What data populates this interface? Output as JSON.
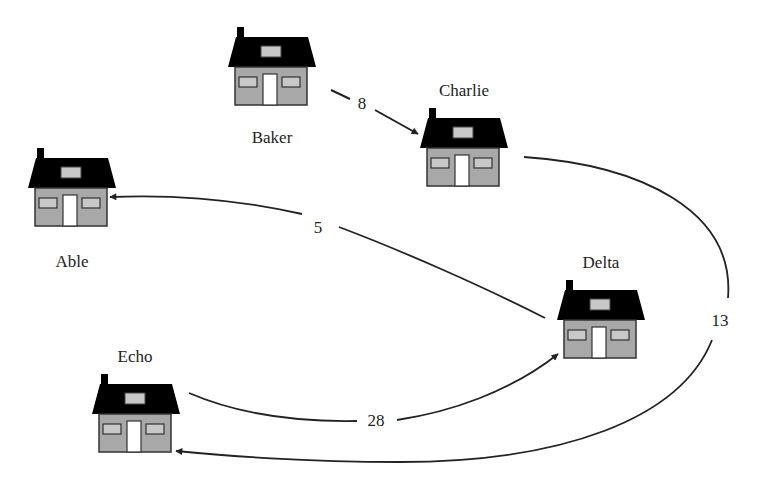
{
  "diagram": {
    "type": "directed-weighted-graph",
    "colors": {
      "roof": "#000000",
      "wall": "#a8a8a8",
      "window": "#c8c8c8",
      "door": "#ffffff",
      "edge": "#222222",
      "text": "#222222"
    },
    "nodes": [
      {
        "id": "able",
        "label": "Able",
        "icon": "house-icon",
        "x": 28,
        "y": 148,
        "label_x": 72,
        "label_y": 262
      },
      {
        "id": "baker",
        "label": "Baker",
        "icon": "house-icon",
        "x": 228,
        "y": 27,
        "label_x": 272,
        "label_y": 138
      },
      {
        "id": "charlie",
        "label": "Charlie",
        "icon": "house-icon",
        "x": 420,
        "y": 108,
        "label_x": 464,
        "label_y": 91
      },
      {
        "id": "delta",
        "label": "Delta",
        "icon": "house-icon",
        "x": 557,
        "y": 280,
        "label_x": 601,
        "label_y": 263
      },
      {
        "id": "echo",
        "label": "Echo",
        "icon": "house-icon",
        "x": 92,
        "y": 374,
        "label_x": 135,
        "label_y": 357
      }
    ],
    "edges": [
      {
        "from": "baker",
        "to": "charlie",
        "weight": "8",
        "label_x": 362,
        "label_y": 104
      },
      {
        "from": "delta",
        "to": "able",
        "weight": "5",
        "label_x": 318,
        "label_y": 228
      },
      {
        "from": "charlie",
        "to": "echo",
        "weight": "13",
        "label_x": 720,
        "label_y": 321
      },
      {
        "from": "echo",
        "to": "delta",
        "weight": "28",
        "label_x": 376,
        "label_y": 421
      }
    ]
  }
}
